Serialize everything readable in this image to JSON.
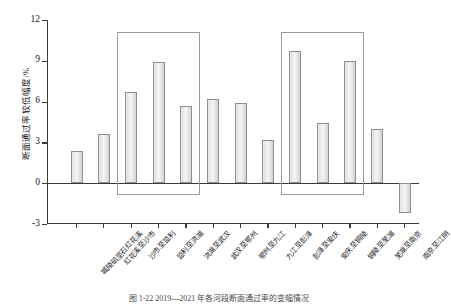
{
  "chart_data": {
    "type": "bar",
    "title": "",
    "xlabel": "",
    "ylabel": "断面通过率较低幅度/%",
    "ylim": [
      -3,
      12
    ],
    "yticks": [
      -3,
      0,
      3,
      6,
      9,
      12
    ],
    "ytick_labels": [
      "-3",
      "0",
      "3",
      "6",
      "9",
      "12"
    ],
    "grid": false,
    "legend": "none",
    "categories": [
      "城陵矶至石红花溪",
      "红花溪至沙市",
      "沙市至监利",
      "监利至洪湖",
      "洪湖至武汉",
      "武汉至鄂州",
      "鄂州至九江",
      "九江至彭泽",
      "彭泽至安庆",
      "安庆至铜陵",
      "铜陵至芜湖",
      "芜湖至南京",
      "南京至江阴"
    ],
    "values": [
      2.4,
      3.6,
      6.7,
      8.9,
      5.7,
      6.2,
      5.9,
      3.2,
      9.7,
      4.4,
      9.0,
      4.0,
      -2.2
    ],
    "annotations": [
      {
        "name": "highlight-box-left",
        "start_index": 2,
        "end_index": 4,
        "label": ""
      },
      {
        "name": "highlight-box-right",
        "start_index": 8,
        "end_index": 10,
        "label": ""
      }
    ]
  },
  "caption": {
    "text": "图 1-22  2019—2021 年各河段断面通过率的变幅情况"
  },
  "colors": {
    "axis": "#3a3a3a",
    "bar_fill": "#e9e9e9",
    "bar_edge": "#8e8e8e",
    "box_edge": "#9a9a9a"
  }
}
